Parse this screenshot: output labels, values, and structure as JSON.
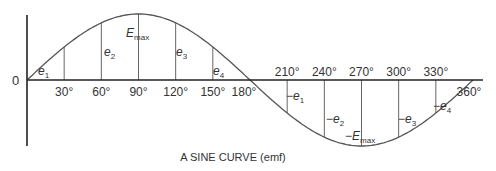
{
  "figure": {
    "caption": "A SINE CURVE (emf)",
    "origin_label": "0",
    "colors": {
      "axis": "#222222",
      "curve": "#555555",
      "ordinate": "#666666",
      "text": "#333333"
    }
  },
  "chart_data": {
    "type": "line",
    "title": "A SINE CURVE (emf)",
    "xlabel": "degrees",
    "ylabel": "emf",
    "x": [
      0,
      30,
      60,
      90,
      120,
      150,
      180,
      210,
      240,
      270,
      300,
      330,
      360
    ],
    "values": [
      0,
      0.5,
      0.866,
      1,
      0.866,
      0.5,
      0,
      -0.5,
      -0.866,
      -1,
      -0.866,
      -0.5,
      0
    ],
    "tick_labels": [
      "30°",
      "60°",
      "90°",
      "120°",
      "150°",
      "180°",
      "210°",
      "240°",
      "270°",
      "300°",
      "330°",
      "360°"
    ],
    "ordinate_labels": [
      {
        "x": 30,
        "base": "e",
        "sub": "1",
        "sign": ""
      },
      {
        "x": 60,
        "base": "e",
        "sub": "2",
        "sign": ""
      },
      {
        "x": 90,
        "base": "E",
        "sub": "max",
        "sign": ""
      },
      {
        "x": 120,
        "base": "e",
        "sub": "3",
        "sign": ""
      },
      {
        "x": 150,
        "base": "e",
        "sub": "4",
        "sign": ""
      },
      {
        "x": 210,
        "base": "e",
        "sub": "1",
        "sign": "−"
      },
      {
        "x": 240,
        "base": "e",
        "sub": "2",
        "sign": "−"
      },
      {
        "x": 270,
        "base": "E",
        "sub": "max",
        "sign": "−"
      },
      {
        "x": 300,
        "base": "e",
        "sub": "3",
        "sign": "−"
      },
      {
        "x": 330,
        "base": "e",
        "sub": "4",
        "sign": "−"
      }
    ],
    "xlim": [
      0,
      360
    ],
    "ylim": [
      -1,
      1
    ],
    "grid": false
  }
}
